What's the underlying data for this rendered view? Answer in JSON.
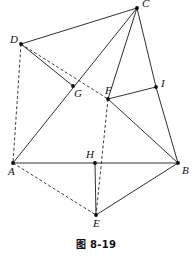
{
  "figure": {
    "caption": "图 8-19",
    "stroke_color": "#1a1a1a",
    "background_color": "#ffffff",
    "width": 192,
    "height": 256,
    "vertices": [
      {
        "id": "C",
        "label": "C",
        "x": 137,
        "y": 8,
        "label_dx": 5,
        "label_dy": -10
      },
      {
        "id": "D",
        "label": "D",
        "x": 21,
        "y": 44,
        "label_dx": -11,
        "label_dy": -10
      },
      {
        "id": "G",
        "label": "G",
        "x": 73,
        "y": 86,
        "label_dx": 1,
        "label_dy": 2
      },
      {
        "id": "F",
        "label": "F",
        "x": 108,
        "y": 99,
        "label_dx": -3,
        "label_dy": -14
      },
      {
        "id": "I",
        "label": "I",
        "x": 156,
        "y": 87,
        "label_dx": 5,
        "label_dy": -9
      },
      {
        "id": "A",
        "label": "A",
        "x": 13,
        "y": 163,
        "label_dx": -5,
        "label_dy": 3
      },
      {
        "id": "H",
        "label": "H",
        "x": 95,
        "y": 163,
        "label_dx": -9,
        "label_dy": -14
      },
      {
        "id": "B",
        "label": "B",
        "x": 178,
        "y": 163,
        "label_dx": 4,
        "label_dy": 2
      },
      {
        "id": "E",
        "label": "E",
        "x": 96,
        "y": 215,
        "label_dx": -3,
        "label_dy": 3
      }
    ],
    "edges_solid": [
      {
        "id": "edge-D-C",
        "from": "D",
        "to": "C"
      },
      {
        "id": "edge-C-A",
        "from": "C",
        "to": "A"
      },
      {
        "id": "edge-C-F",
        "from": "C",
        "to": "F"
      },
      {
        "id": "edge-C-I",
        "from": "C",
        "to": "I"
      },
      {
        "id": "edge-I-B",
        "from": "I",
        "to": "B"
      },
      {
        "id": "edge-F-I",
        "from": "F",
        "to": "I"
      },
      {
        "id": "edge-F-B",
        "from": "F",
        "to": "B"
      },
      {
        "id": "edge-D-G",
        "from": "D",
        "to": "G"
      },
      {
        "id": "edge-A-B",
        "from": "A",
        "to": "B"
      },
      {
        "id": "edge-H-E",
        "from": "H",
        "to": "E"
      },
      {
        "id": "edge-E-B",
        "from": "E",
        "to": "B"
      }
    ],
    "edges_dashed": [
      {
        "id": "edge-D-A-dashed",
        "from": "D",
        "to": "A"
      },
      {
        "id": "edge-D-F-dashed",
        "from": "D",
        "to": "F"
      },
      {
        "id": "edge-F-E-dashed",
        "from": "F",
        "to": "E"
      },
      {
        "id": "edge-A-E-dashed",
        "from": "A",
        "to": "E"
      }
    ]
  }
}
